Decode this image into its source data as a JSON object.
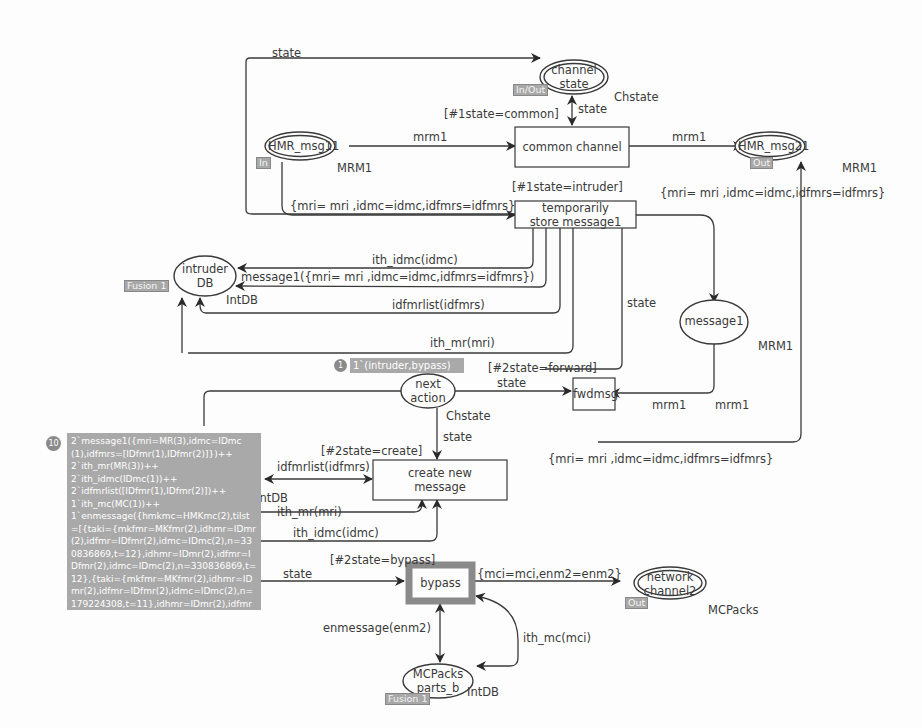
{
  "net": {
    "places": {
      "channel_state": {
        "label": "channel\nstate",
        "line1": "channel",
        "line2": "state",
        "color_set": "Chstate",
        "port": "In/Out"
      },
      "hmr_msg11": {
        "label": "HMR_msg11",
        "color_set": "MRM1",
        "port": "In"
      },
      "hmr_msg21": {
        "label": "HMR_msg21",
        "color_set": "MRM1",
        "port": "Out"
      },
      "intruder_db": {
        "line1": "intruder",
        "line2": "DB",
        "color_set": "IntDB",
        "fusion": "Fusion 1"
      },
      "message1": {
        "label": "message1",
        "color_set": "MRM1"
      },
      "next_action": {
        "line1": "next",
        "line2": "action",
        "color_set": "Chstate",
        "token_count": "1",
        "marking": "1`(intruder,bypass)"
      },
      "intdb_left": {
        "color_set": "IntDB",
        "token_count": "10"
      },
      "network_channel2": {
        "line1": "network",
        "line2": "channel2",
        "color_set": "MCPacks",
        "port": "Out"
      },
      "mcpacks_parts_b": {
        "line1": "MCPacks",
        "line2": "parts_b",
        "color_set": "IntDB",
        "fusion": "Fusion 1"
      }
    },
    "transitions": {
      "common_channel": {
        "label": "common channel",
        "guard": "[#1state=common]"
      },
      "temporarily_store": {
        "line1": "temporarily",
        "line2": "store message1",
        "guard": "[#1state=intruder]"
      },
      "fwdmsg": {
        "label": "fwdmsg",
        "guard": "[#2state=forward]"
      },
      "create_new_message": {
        "line1": "create new",
        "line2": "message",
        "guard": "[#2state=create]"
      },
      "bypass": {
        "label": "bypass",
        "guard": "[#2state=bypass]"
      }
    },
    "arcs": {
      "top_state": "state",
      "cs_state": "state",
      "hmr11_common": "mrm1",
      "common_hmr21": "mrm1",
      "hmr11_temp": "{mri= mri ,idmc=idmc,idfmrs=idfmrs}",
      "temp_hmr21": "{mri= mri ,idmc=idmc,idfmrs=idfmrs}",
      "temp_db_idmc": "ith_idmc(idmc)",
      "temp_db_msg": "message1({mri= mri ,idmc=idmc,idfmrs=idfmrs})",
      "temp_db_idfmr": "idfmrlist(idfmrs)",
      "temp_db_mr": "ith_mr(mri)",
      "temp_state": "state",
      "na_fwd_state": "state",
      "msg1_fwd": "mrm1",
      "fwd_mrm1": "mrm1",
      "na_create_state": "state",
      "create_idfmr": "idfmrlist(idfmrs)",
      "create_mr": "ith_mr(mri)",
      "create_idmc": "ith_idmc(idmc)",
      "create_out": "{mri= mri ,idmc=idmc,idfmrs=idfmrs}",
      "bypass_state": "state",
      "bypass_out": "{mci=mci,enm2=enm2}",
      "bypass_enm": "enmessage(enm2)",
      "bypass_mc": "ith_mc(mci)"
    },
    "intdb_marking": "2`message1({mri=MR(3),idmc=IDmc(1),idfmrs=[IDfmr(1),IDfmr(2)]})++\n2`ith_mr(MR(3))++\n2`ith_idmc(IDmc(1))++\n2`idfmrlist([IDfmr(1),IDfmr(2)])++\n1`ith_mc(MC(1))++\n1`enmessage({hmkmc=HMKmc(2),tilst=[{taki={mkfmr=MKfmr(2),idhmr=IDmr(2),idfmr=IDfmr(2),idmc=IDmc(2),n=330836869,t=12},idhmr=IDmr(2),idfmr=IDfmr(2),idmc=IDmc(2),n=330836869,t=12},{taki={mkfmr=MKfmr(2),idhmr=IDmr(2),idfmr=IDfmr(2),idmc=IDmc(2),n=179224308,t=11},idhmr=IDmr(2),idfmr=IDfmr(2),idmc=IDmc(2),n=179224308,t=11}]})"
  },
  "colors": {
    "line": "#3a3a3a",
    "token_bg": "#a9a9a9",
    "highlight": "#8a8a8a",
    "background": "#fdfdfd"
  }
}
